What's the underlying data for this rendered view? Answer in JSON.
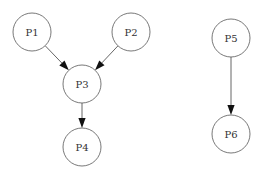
{
  "diagram": {
    "type": "directed-graph",
    "nodes": [
      {
        "id": "P1",
        "label": "P1",
        "cx": 32,
        "cy": 32,
        "r": 19
      },
      {
        "id": "P2",
        "label": "P2",
        "cx": 131,
        "cy": 32,
        "r": 19
      },
      {
        "id": "P3",
        "label": "P3",
        "cx": 82,
        "cy": 84,
        "r": 19
      },
      {
        "id": "P4",
        "label": "P4",
        "cx": 82,
        "cy": 147,
        "r": 19
      },
      {
        "id": "P5",
        "label": "P5",
        "cx": 231,
        "cy": 38,
        "r": 19
      },
      {
        "id": "P6",
        "label": "P6",
        "cx": 231,
        "cy": 134,
        "r": 19
      }
    ],
    "edges": [
      {
        "from": "P1",
        "to": "P3"
      },
      {
        "from": "P2",
        "to": "P3"
      },
      {
        "from": "P3",
        "to": "P4"
      },
      {
        "from": "P5",
        "to": "P6"
      }
    ]
  }
}
